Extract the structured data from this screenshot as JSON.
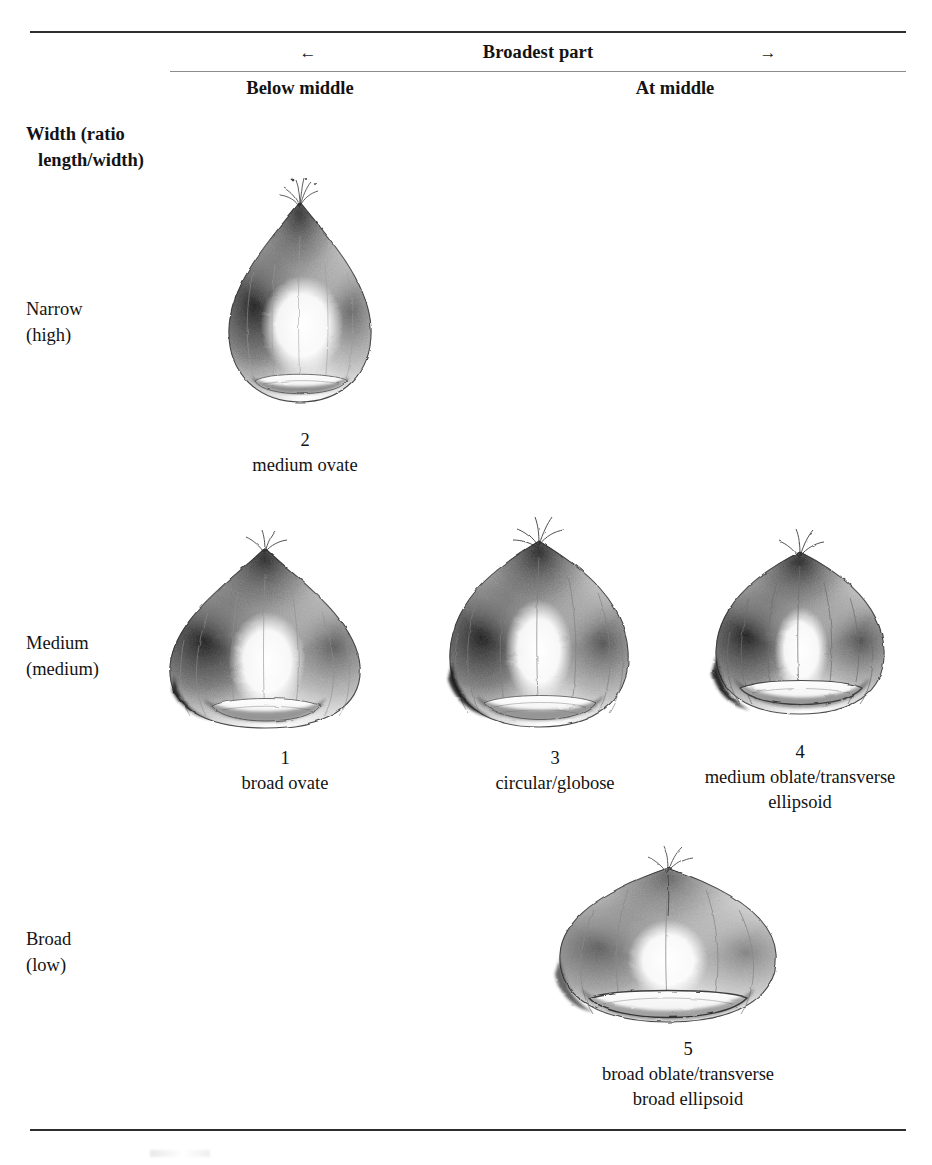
{
  "table": {
    "span_header": {
      "left_arrow": "←",
      "title": "Broadest part",
      "right_arrow": "→"
    },
    "column_headers": [
      "Below middle",
      "At middle"
    ],
    "stub_header": {
      "line1": "Width (ratio",
      "line2": "length/width)"
    },
    "rows": [
      {
        "label": "Narrow",
        "qualifier": "(high)"
      },
      {
        "label": "Medium",
        "qualifier": "(medium)"
      },
      {
        "label": "Broad",
        "qualifier": "(low)"
      }
    ]
  },
  "figures": [
    {
      "id": "fig-2",
      "number": "2",
      "name": "medium ovate",
      "row": "Narrow (high)",
      "column": "Below middle",
      "icon": "chestnut-nut-illustration"
    },
    {
      "id": "fig-1",
      "number": "1",
      "name": "broad ovate",
      "row": "Medium (medium)",
      "column": "Below middle",
      "icon": "chestnut-nut-illustration"
    },
    {
      "id": "fig-3",
      "number": "3",
      "name": "circular/globose",
      "row": "Medium (medium)",
      "column": "At middle",
      "icon": "chestnut-nut-illustration"
    },
    {
      "id": "fig-4",
      "number": "4",
      "name_line1": "medium oblate/transverse",
      "name_line2": "ellipsoid",
      "row": "Medium (medium)",
      "column": "At middle",
      "icon": "chestnut-nut-illustration"
    },
    {
      "id": "fig-5",
      "number": "5",
      "name_line1": "broad oblate/transverse",
      "name_line2": "broad ellipsoid",
      "row": "Broad (low)",
      "column": "At middle",
      "icon": "chestnut-nut-illustration"
    }
  ],
  "colors": {
    "page_background": "#ffffff",
    "text": "#131313",
    "heavy_rule": "#2e2e2e",
    "light_rule": "#8d8d8d",
    "pencil_dark": "#2b2b2b",
    "pencil_mid": "#6e6e6e",
    "pencil_light": "#c9c9c9"
  }
}
